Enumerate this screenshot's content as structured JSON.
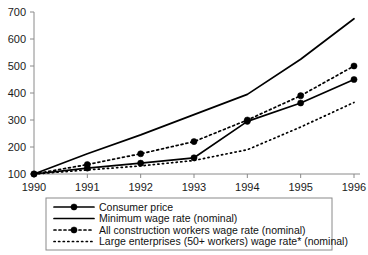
{
  "chart_data": {
    "type": "line",
    "title": "",
    "xlabel": "",
    "ylabel": "",
    "categories": [
      "1990",
      "1991",
      "1992",
      "1993",
      "1994",
      "1995",
      "1996"
    ],
    "x": [
      1990,
      1991,
      1992,
      1993,
      1994,
      1995,
      1996
    ],
    "xlim": [
      1990,
      1996
    ],
    "ylim": [
      100,
      700
    ],
    "ytick_labels": [
      "100",
      "200",
      "300",
      "400",
      "500",
      "600",
      "700"
    ],
    "yticks": [
      100,
      200,
      300,
      400,
      500,
      600,
      700
    ],
    "grid": false,
    "legend_position": "below-plot",
    "series": [
      {
        "name": "Consumer price",
        "style": "solid",
        "marker": "filled-circle",
        "values": [
          100,
          122,
          140,
          160,
          295,
          363,
          450
        ]
      },
      {
        "name": "Minimum wage rate (nominal)",
        "style": "solid",
        "marker": "none",
        "values": [
          100,
          175,
          245,
          320,
          395,
          525,
          675
        ]
      },
      {
        "name": "All construction workers wage rate (nominal)",
        "style": "dash-dot",
        "marker": "filled-circle",
        "values": [
          100,
          135,
          175,
          220,
          300,
          390,
          500
        ]
      },
      {
        "name": "Large enterprises (50+ workers) wage rate* (nominal)",
        "style": "dotted",
        "marker": "none",
        "values": [
          100,
          115,
          130,
          150,
          190,
          274,
          365
        ]
      }
    ]
  },
  "axes": {
    "y_ticks": [
      {
        "label": "700",
        "value": 700
      },
      {
        "label": "600",
        "value": 600
      },
      {
        "label": "500",
        "value": 500
      },
      {
        "label": "400",
        "value": 400
      },
      {
        "label": "300",
        "value": 300
      },
      {
        "label": "200",
        "value": 200
      },
      {
        "label": "100",
        "value": 100
      }
    ],
    "x_ticks": [
      {
        "label": "1990",
        "value": 1990
      },
      {
        "label": "1991",
        "value": 1991
      },
      {
        "label": "1992",
        "value": 1992
      },
      {
        "label": "1993",
        "value": 1993
      },
      {
        "label": "1994",
        "value": 1994
      },
      {
        "label": "1995",
        "value": 1995
      },
      {
        "label": "1996",
        "value": 1996
      }
    ]
  },
  "legend": {
    "items": [
      {
        "label": "Consumer price",
        "style": "solid",
        "marker": "filled-circle"
      },
      {
        "label": "Minimum wage rate (nominal)",
        "style": "solid",
        "marker": "none"
      },
      {
        "label": "All construction workers wage rate (nominal)",
        "style": "dash-dot",
        "marker": "filled-circle"
      },
      {
        "label": "Large enterprises (50+ workers) wage rate* (nominal)",
        "style": "dotted",
        "marker": "none"
      }
    ]
  },
  "colors": {
    "ink": "#000000",
    "axis": "#8a8a8a",
    "background": "#ffffff"
  }
}
